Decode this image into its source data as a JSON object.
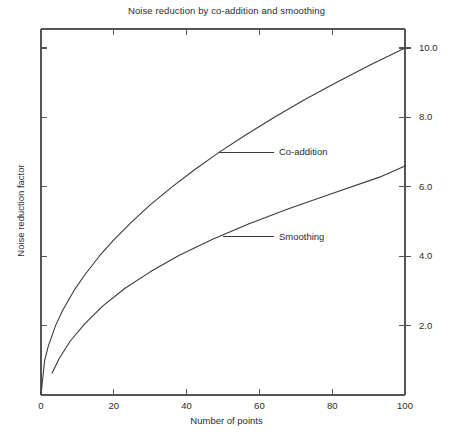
{
  "chart_data": {
    "type": "line",
    "title": "Noise reduction by co-addition and smoothing",
    "xlabel": "Number of points",
    "ylabel": "Noise reduction factor",
    "xlim": [
      0,
      100
    ],
    "ylim": [
      0,
      10.55
    ],
    "grid": false,
    "legend_position": "inline-annotations",
    "xticks": [
      0,
      20,
      40,
      60,
      80,
      100
    ],
    "xtick_labels": [
      "0",
      "20",
      "40",
      "60",
      "80",
      "100"
    ],
    "yticks": [
      2.0,
      4.0,
      6.0,
      8.0,
      10.0
    ],
    "ytick_labels": [
      "2.0",
      "4.0",
      "6.0",
      "8.0",
      "10.0"
    ],
    "yaxis_side": "right",
    "series": [
      {
        "name": "Co-addition",
        "annotation": "Co-addition",
        "x": [
          0,
          1,
          2,
          4,
          6,
          9,
          12,
          16,
          20,
          25,
          30,
          36,
          42,
          49,
          56,
          64,
          72,
          81,
          90,
          100
        ],
        "values": [
          0.0,
          1.0,
          1.41,
          2.0,
          2.45,
          3.0,
          3.46,
          4.0,
          4.47,
          5.0,
          5.48,
          6.0,
          6.48,
          7.0,
          7.48,
          8.0,
          8.49,
          9.0,
          9.49,
          10.0
        ]
      },
      {
        "name": "Smoothing",
        "annotation": "Smoothing",
        "x": [
          3,
          5,
          8,
          12,
          17,
          23,
          30,
          38,
          47,
          57,
          68,
          80,
          93,
          100
        ],
        "values": [
          0.62,
          1.05,
          1.55,
          2.05,
          2.57,
          3.07,
          3.55,
          4.03,
          4.48,
          4.93,
          5.37,
          5.81,
          6.28,
          6.6
        ]
      }
    ],
    "annotations": [
      {
        "text": "Co-addition",
        "curve_point_x": 49,
        "curve_point_y": 7.0,
        "label_x": 64,
        "label_y": 7.0
      },
      {
        "text": "Smoothing",
        "curve_point_x": 50,
        "curve_point_y": 4.56,
        "label_x": 64,
        "label_y": 4.56
      }
    ],
    "colors": {
      "axis": "#555555",
      "curve": "#3a3a3a",
      "text": "#2b2b2b",
      "background": "#ffffff"
    }
  }
}
